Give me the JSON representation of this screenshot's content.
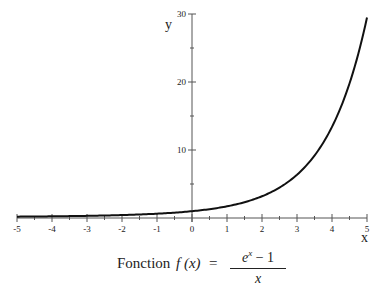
{
  "chart_data": {
    "type": "line",
    "xlabel": "x",
    "ylabel": "y",
    "xlim": [
      -5,
      5
    ],
    "ylim": [
      0,
      30
    ],
    "x_ticks": [
      -5,
      -4,
      -3,
      -2,
      -1,
      0,
      1,
      2,
      3,
      4,
      5
    ],
    "y_ticks": [
      10,
      20,
      30
    ],
    "grid": false,
    "legend": null,
    "series": [
      {
        "name": "f(x) = (e^x - 1)/x",
        "x": [
          -5,
          -4,
          -3,
          -2,
          -1,
          0,
          1,
          2,
          3,
          3.5,
          4,
          4.5,
          5
        ],
        "y": [
          0.2,
          0.25,
          0.32,
          0.43,
          0.63,
          1.0,
          1.72,
          3.19,
          6.36,
          9.72,
          13.4,
          19.78,
          29.48
        ]
      }
    ]
  },
  "axes": {
    "x_label": "x",
    "y_label": "y",
    "x_tick_labels": [
      "-5",
      "-4",
      "-3",
      "-2",
      "-1",
      "0",
      "1",
      "2",
      "3",
      "4",
      "5"
    ],
    "y_tick_labels": [
      "10",
      "20",
      "30"
    ]
  },
  "caption": {
    "word": "Fonction",
    "fx": "f (x)",
    "equals": "=",
    "numerator_base": "e",
    "numerator_exp": "x",
    "numerator_rest": " − 1",
    "denominator": "x"
  },
  "colors": {
    "curve": "#111111",
    "axis": "#555555"
  }
}
